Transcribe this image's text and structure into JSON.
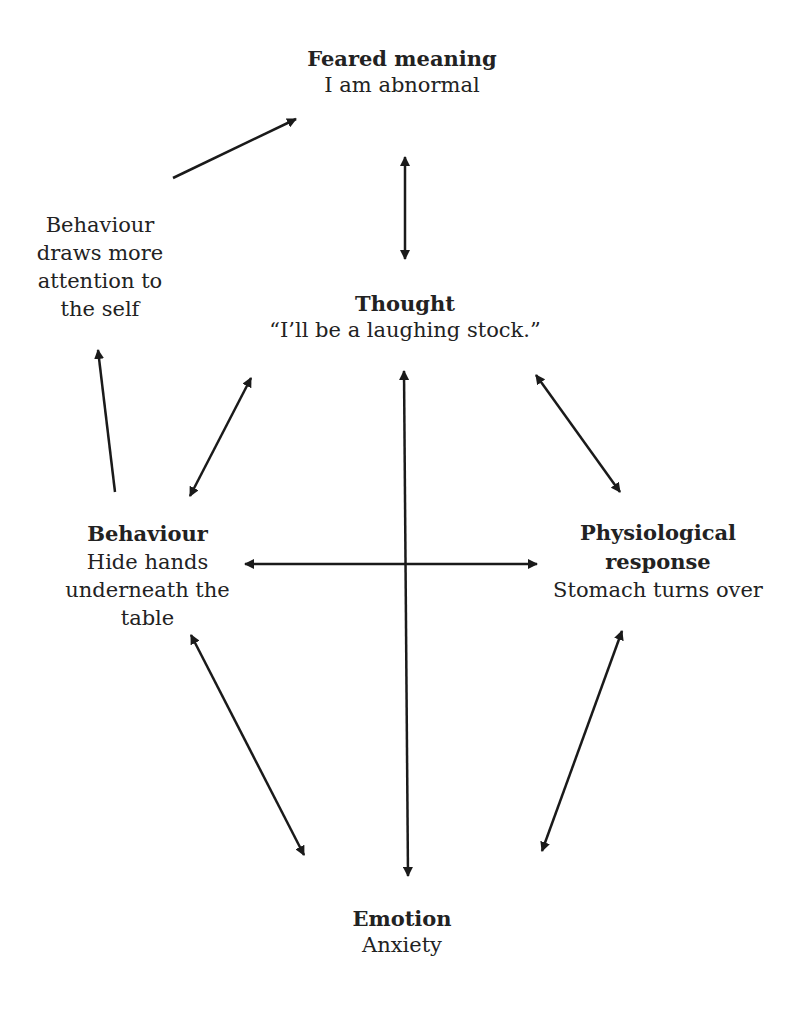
{
  "diagram": {
    "nodes": {
      "feared_meaning": {
        "title": "Feared meaning",
        "body": "I am abnormal"
      },
      "attention": {
        "title": "",
        "body": "Behaviour\ndraws more\nattention to\nthe self"
      },
      "thought": {
        "title": "Thought",
        "body": "“I’ll be a laughing stock.”"
      },
      "behaviour": {
        "title": "Behaviour",
        "body": "Hide hands\nunderneath the\ntable"
      },
      "physiological": {
        "title": "Physiological\nresponse",
        "body": "Stomach turns over"
      },
      "emotion": {
        "title": "Emotion",
        "body": "Anxiety"
      }
    },
    "edges": [
      {
        "from": "attention",
        "to": "feared_meaning",
        "type": "one-way"
      },
      {
        "from": "feared_meaning",
        "to": "thought",
        "type": "two-way"
      },
      {
        "from": "behaviour",
        "to": "attention",
        "type": "one-way"
      },
      {
        "from": "behaviour",
        "to": "thought",
        "type": "two-way"
      },
      {
        "from": "thought",
        "to": "emotion",
        "type": "two-way"
      },
      {
        "from": "thought",
        "to": "physiological",
        "type": "two-way"
      },
      {
        "from": "behaviour",
        "to": "physiological",
        "type": "two-way"
      },
      {
        "from": "behaviour",
        "to": "emotion",
        "type": "two-way"
      },
      {
        "from": "physiological",
        "to": "emotion",
        "type": "two-way"
      }
    ],
    "colors": {
      "text": "#222222",
      "arrow": "#1a1a1a",
      "background": "#ffffff"
    }
  }
}
